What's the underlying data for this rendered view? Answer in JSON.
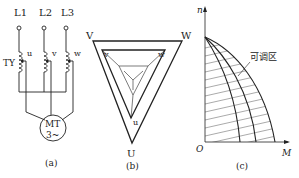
{
  "panel_a": {
    "lines": [
      "L1",
      "L2",
      "L3"
    ],
    "line_sub": [
      "1",
      "2",
      "3"
    ],
    "taps": [
      "u",
      "v",
      "w"
    ],
    "regulator_label": "TY",
    "motor_label_1": "MT",
    "motor_label_2": "3~",
    "caption": "(a)"
  },
  "panel_b": {
    "outer": [
      "V",
      "W",
      "U"
    ],
    "inner": [
      "v",
      "w",
      "u"
    ],
    "caption": "(b)"
  },
  "panel_c": {
    "y_axis": "n",
    "x_axis": "M",
    "origin": "O",
    "region_label": "可调区",
    "caption": "(c)"
  }
}
